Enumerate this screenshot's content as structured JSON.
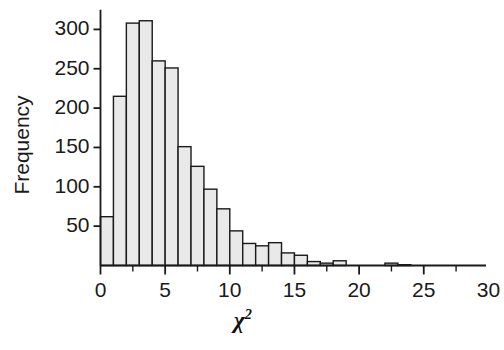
{
  "chart_data": {
    "type": "bar",
    "title": "",
    "subtitle": "",
    "xlabel": "χ²",
    "xlabel_base": "χ",
    "xlabel_exponent": "2",
    "ylabel": "Frequency",
    "xlim": [
      0,
      30
    ],
    "ylim": [
      0,
      330
    ],
    "grid": false,
    "legend": null,
    "bin_width": 1,
    "bar_fill_color": "#e9e9e9",
    "bar_edge_color": "#1a1a1a",
    "axis_color": "#1a1a1a",
    "background_color": "#ffffff",
    "xticks": [
      0,
      5,
      10,
      15,
      20,
      25,
      30
    ],
    "xtick_labels": [
      "0",
      "5",
      "10",
      "15",
      "20",
      "25",
      "30"
    ],
    "xminor_ticks": [
      2.5,
      7.5,
      12.5,
      17.5,
      22.5,
      27.5
    ],
    "yticks": [
      50,
      100,
      150,
      200,
      250,
      300
    ],
    "ytick_labels": [
      "50",
      "100",
      "150",
      "200",
      "250",
      "300"
    ],
    "categories": [
      "0-1",
      "1-2",
      "2-3",
      "3-4",
      "4-5",
      "5-6",
      "6-7",
      "7-8",
      "9-9",
      "9-10",
      "10-11",
      "11-12",
      "12-13",
      "13-14",
      "14-15",
      "15-16",
      "16-17",
      "17-18",
      "18-19",
      "19-20",
      "20-21",
      "21-22",
      "22-23",
      "23-24"
    ],
    "x": [
      0,
      1,
      2,
      3,
      4,
      5,
      6,
      7,
      8,
      9,
      10,
      11,
      12,
      13,
      14,
      15,
      16,
      17,
      18,
      19,
      20,
      21,
      22,
      23
    ],
    "values": [
      62,
      215,
      308,
      311,
      260,
      251,
      151,
      126,
      97,
      72,
      44,
      28,
      25,
      29,
      16,
      13,
      5,
      3,
      6,
      0,
      0,
      0,
      3,
      1
    ]
  }
}
